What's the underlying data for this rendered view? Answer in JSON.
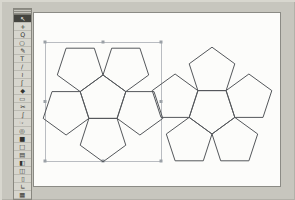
{
  "window": {
    "name": "vector-drawing-app",
    "background": "#c7c6be"
  },
  "toolbar": {
    "selected_tool": "selection-tool",
    "tools": [
      {
        "name": "selection-tool",
        "glyph": "↖"
      },
      {
        "name": "direct-select-tool",
        "glyph": "+"
      },
      {
        "name": "zoom-tool",
        "glyph": "Q"
      },
      {
        "name": "ellipse-tool",
        "glyph": "○"
      },
      {
        "name": "pen-tool",
        "glyph": "✎"
      },
      {
        "name": "text-tool",
        "glyph": "T"
      },
      {
        "name": "line-tool",
        "glyph": "/"
      },
      {
        "name": "curve-tool",
        "glyph": "≀"
      },
      {
        "name": "pencil-tool",
        "glyph": "ʃ"
      },
      {
        "name": "brush-tool",
        "glyph": "◆"
      },
      {
        "name": "eraser-tool",
        "glyph": "▭"
      },
      {
        "name": "scissors-tool",
        "glyph": "✂"
      },
      {
        "name": "spiral-tool",
        "glyph": "∫"
      },
      {
        "name": "hand-tool",
        "glyph": "☞"
      },
      {
        "name": "blend-tool",
        "glyph": "◎"
      },
      {
        "name": "filled-rect-tool",
        "glyph": "■"
      },
      {
        "name": "rect-tool",
        "glyph": "□"
      },
      {
        "name": "pattern-tool",
        "glyph": "▤"
      },
      {
        "name": "gradient-tool",
        "glyph": "◧"
      },
      {
        "name": "column-tool",
        "glyph": "◫"
      },
      {
        "name": "page-tool",
        "glyph": "▯"
      },
      {
        "name": "measure-tool",
        "glyph": "∟"
      },
      {
        "name": "graph-tool",
        "glyph": "▦"
      }
    ]
  },
  "page": {
    "background": "#fcfcfa",
    "border_color": "#8b8b85"
  },
  "drawing": {
    "stroke_color": "#54575b",
    "flowers": [
      {
        "name": "dodecahedron-net-left-half",
        "cx": 103,
        "cy": 99,
        "r": 24,
        "pointing": "up",
        "selected": true
      },
      {
        "name": "dodecahedron-net-right-half",
        "cx": 212,
        "cy": 110,
        "r": 24,
        "pointing": "down",
        "selected": false
      }
    ]
  },
  "selection": {
    "x": 45,
    "y": 42,
    "width": 116,
    "height": 119,
    "stroke": "#b9bcc1",
    "handle_color": "#9aa0a6",
    "handle_size": 3
  }
}
